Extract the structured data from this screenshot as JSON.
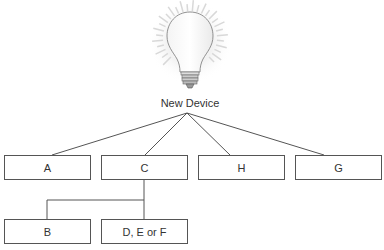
{
  "root": {
    "label": "New Device",
    "icon": "lightbulb-icon"
  },
  "children": [
    {
      "label": "A"
    },
    {
      "label": "C"
    },
    {
      "label": "H"
    },
    {
      "label": "G"
    }
  ],
  "grandchildren": [
    {
      "label": "B",
      "parent": "C"
    },
    {
      "label": "D, E or F",
      "parent": "C"
    }
  ]
}
